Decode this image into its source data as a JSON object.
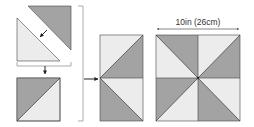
{
  "diagram": {
    "colors": {
      "dark": "#a3a3a3",
      "light": "#ececec",
      "line": "#444444",
      "bracket": "#888888",
      "arrow": "#222222",
      "background": "#ffffff"
    },
    "steps": [
      {
        "id": "step-1",
        "description": "Join dark triangle and light triangle along diagonal"
      },
      {
        "id": "step-2",
        "description": "Half-square triangle unit"
      },
      {
        "id": "step-3",
        "description": "Join two units into a column"
      },
      {
        "id": "step-4",
        "description": "Finished pinwheel block"
      }
    ],
    "dimension_label": "10in (26cm)"
  }
}
